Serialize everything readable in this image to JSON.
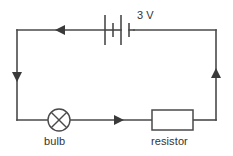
{
  "diagram": {
    "type": "series-circuit-schematic",
    "background_color": "#ffffff",
    "line_color": "#4a4a4a",
    "text_color": "#333333",
    "width": 233,
    "height": 156,
    "components": {
      "battery": {
        "symbol": "battery-two-cell",
        "voltage_label": "3 V",
        "position": "top-wire-center",
        "cells": 2
      },
      "bulb": {
        "symbol": "lamp-circle-cross",
        "label": "bulb",
        "position": "bottom-wire-left"
      },
      "resistor": {
        "symbol": "resistor-rectangle",
        "label": "resistor",
        "position": "bottom-wire-right"
      }
    },
    "current_arrows": [
      {
        "name": "top-wire-arrow",
        "direction": "left"
      },
      {
        "name": "left-wire-arrow",
        "direction": "down"
      },
      {
        "name": "bottom-wire-arrow",
        "direction": "right"
      },
      {
        "name": "right-wire-arrow",
        "direction": "up"
      }
    ]
  }
}
